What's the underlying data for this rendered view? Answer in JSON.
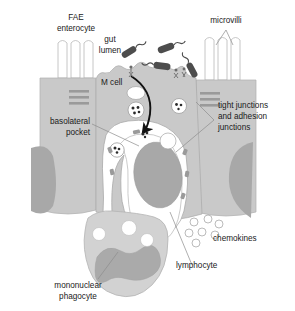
{
  "figure": {
    "type": "biological-schematic"
  },
  "palette": {
    "epithelium_fill": "#c9c9c9",
    "nucleus_fill": "#a8a8a8",
    "pocket_fill": "#ffffff",
    "phagocyte_fill": "#d2d2d2",
    "phagocyte_nucleus": "#aaaaaa",
    "bacteria_fill": "#4d4d4d",
    "outline": "#8c8c8c",
    "text": "#1a1a1a",
    "background": "#ffffff"
  },
  "labels": {
    "fae_enterocyte": {
      "line1": "FAE",
      "line2": "enterocyte"
    },
    "gut_lumen": {
      "line1": "gut",
      "line2": "lumen"
    },
    "microvilli": "microvilli",
    "m_cell": "M cell",
    "basolateral_pocket": {
      "line1": "basolateral",
      "line2": "pocket"
    },
    "junctions": {
      "line1": "tight junctions",
      "line2": "and adhesion",
      "line3": "junctions"
    },
    "chemokines": "chemokines",
    "lymphocyte": "lymphocyte",
    "mononuclear_phagocyte": {
      "line1": "mononuclear",
      "line2": "phagocyte"
    }
  },
  "structures": {
    "bacteria_count": 4,
    "chemokine_count": 7,
    "junction_bars_per_side": 3,
    "microvilli_left_count": 3,
    "microvilli_right_count": 3,
    "phagocyte_vacuole_count": 3,
    "transcytosis_arrow": "apical-to-basolateral"
  },
  "icons": {
    "bacterium": "rod-bacterium-icon",
    "chemokine": "chemokine-dot-icon",
    "junction": "junction-bar-icon",
    "arrow": "transcytosis-arrow-icon",
    "microvillus": "microvillus-icon"
  }
}
